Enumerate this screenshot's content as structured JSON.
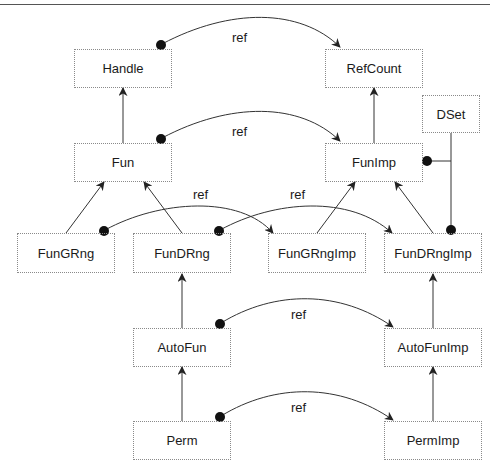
{
  "nodes": {
    "handle": "Handle",
    "refcount": "RefCount",
    "dset": "DSet",
    "fun": "Fun",
    "funimp": "FunImp",
    "fungrng": "FunGRng",
    "fundrng": "FunDRng",
    "fungrngimp": "FunGRngImp",
    "fundrngimp": "FunDRngImp",
    "autofun": "AutoFun",
    "autofunimp": "AutoFunImp",
    "perm": "Perm",
    "permimp": "PermImp"
  },
  "edge_labels": {
    "handle_refcount": "ref",
    "fun_funimp": "ref",
    "fungrng_fungrngimp": "ref",
    "fundrng_fundrngimp": "ref",
    "autofun_autofunimp": "ref",
    "perm_permimp": "ref"
  },
  "edges": [
    {
      "from": "Handle",
      "to": "RefCount",
      "type": "ref",
      "label": "ref"
    },
    {
      "from": "Fun",
      "to": "FunImp",
      "type": "ref",
      "label": "ref"
    },
    {
      "from": "FunGRng",
      "to": "FunGRngImp",
      "type": "ref",
      "label": "ref"
    },
    {
      "from": "FunDRng",
      "to": "FunDRngImp",
      "type": "ref",
      "label": "ref"
    },
    {
      "from": "AutoFun",
      "to": "AutoFunImp",
      "type": "ref",
      "label": "ref"
    },
    {
      "from": "Perm",
      "to": "PermImp",
      "type": "ref",
      "label": "ref"
    },
    {
      "from": "Fun",
      "to": "Handle",
      "type": "inherits"
    },
    {
      "from": "FunImp",
      "to": "RefCount",
      "type": "inherits"
    },
    {
      "from": "FunGRng",
      "to": "Fun",
      "type": "inherits"
    },
    {
      "from": "FunDRng",
      "to": "Fun",
      "type": "inherits"
    },
    {
      "from": "FunGRngImp",
      "to": "FunImp",
      "type": "inherits"
    },
    {
      "from": "FunDRngImp",
      "to": "FunImp",
      "type": "inherits"
    },
    {
      "from": "AutoFun",
      "to": "FunDRng",
      "type": "inherits"
    },
    {
      "from": "AutoFunImp",
      "to": "FunDRngImp",
      "type": "inherits"
    },
    {
      "from": "Perm",
      "to": "AutoFun",
      "type": "inherits"
    },
    {
      "from": "PermImp",
      "to": "AutoFunImp",
      "type": "inherits"
    },
    {
      "from": "DSet",
      "to": [
        "FunImp",
        "FunDRngImp"
      ],
      "type": "association"
    }
  ],
  "colors": {
    "line": "#333333",
    "box_border": "#8a8a8a",
    "text": "#1a1a1a"
  }
}
